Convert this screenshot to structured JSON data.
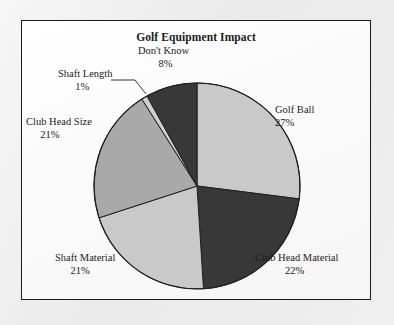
{
  "page": {
    "background_color": "#ececec",
    "frame_border_color": "#1a1a1a",
    "frame_background_color": "#fbfbfb"
  },
  "chart_data": {
    "type": "pie",
    "title": "Golf Equipment Impact",
    "xlabel": "",
    "ylabel": "",
    "legend_position": "none",
    "label_format": "name + percent, placed outside slices",
    "start_angle_deg": 0,
    "direction": "clockwise",
    "categories": [
      "Golf Ball",
      "Club Head Material",
      "Shaft Material",
      "Club Head Size",
      "Shaft Length",
      "Don't Know"
    ],
    "values": [
      27,
      22,
      21,
      21,
      1,
      8
    ],
    "unit": "%",
    "slices": [
      {
        "name": "Golf Ball",
        "percent": 27,
        "percent_label": "27%",
        "color": "#c9c9c9",
        "leader_line": false
      },
      {
        "name": "Club Head Material",
        "percent": 22,
        "percent_label": "22%",
        "color": "#383838",
        "leader_line": false
      },
      {
        "name": "Shaft Material",
        "percent": 21,
        "percent_label": "21%",
        "color": "#c9c9c9",
        "leader_line": false
      },
      {
        "name": "Club Head Size",
        "percent": 21,
        "percent_label": "21%",
        "color": "#a9a9a9",
        "leader_line": false
      },
      {
        "name": "Shaft Length",
        "percent": 1,
        "percent_label": "1%",
        "color": "#cfcfcf",
        "leader_line": true
      },
      {
        "name": "Don't Know",
        "percent": 8,
        "percent_label": "8%",
        "color": "#383838",
        "leader_line": false
      }
    ]
  }
}
